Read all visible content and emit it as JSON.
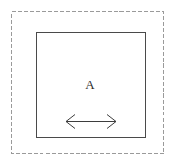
{
  "figure": {
    "canvas": {
      "width": 181,
      "height": 166,
      "background_color": "#ffffff"
    },
    "outer_boundary": {
      "name": "dashed-domain-boundary",
      "shape": "rectangle",
      "style": "dashed",
      "stroke_color": "#9a9a9a",
      "stroke_width": 1,
      "dash_pattern": "4 2",
      "x": 11,
      "y": 11,
      "width": 152,
      "height": 142
    },
    "inner_region": {
      "name": "region-a-rectangle",
      "shape": "rectangle",
      "style": "solid",
      "stroke_color": "#4a4a4a",
      "stroke_width": 1,
      "fill_color": "none",
      "x": 36,
      "y": 32,
      "width": 109,
      "height": 105
    },
    "label": {
      "name": "region-label-a",
      "text": "A",
      "color": "#2b2b2b",
      "x": 90,
      "y": 89,
      "font_size": 13
    },
    "arrow": {
      "name": "width-dimension-arrow",
      "type": "double-headed-horizontal",
      "stroke_color": "#3d3d3d",
      "stroke_width": 1,
      "y": 121,
      "x_start": 66,
      "x_end": 116,
      "head_length": 9,
      "head_half_height": 7,
      "label": ""
    }
  }
}
